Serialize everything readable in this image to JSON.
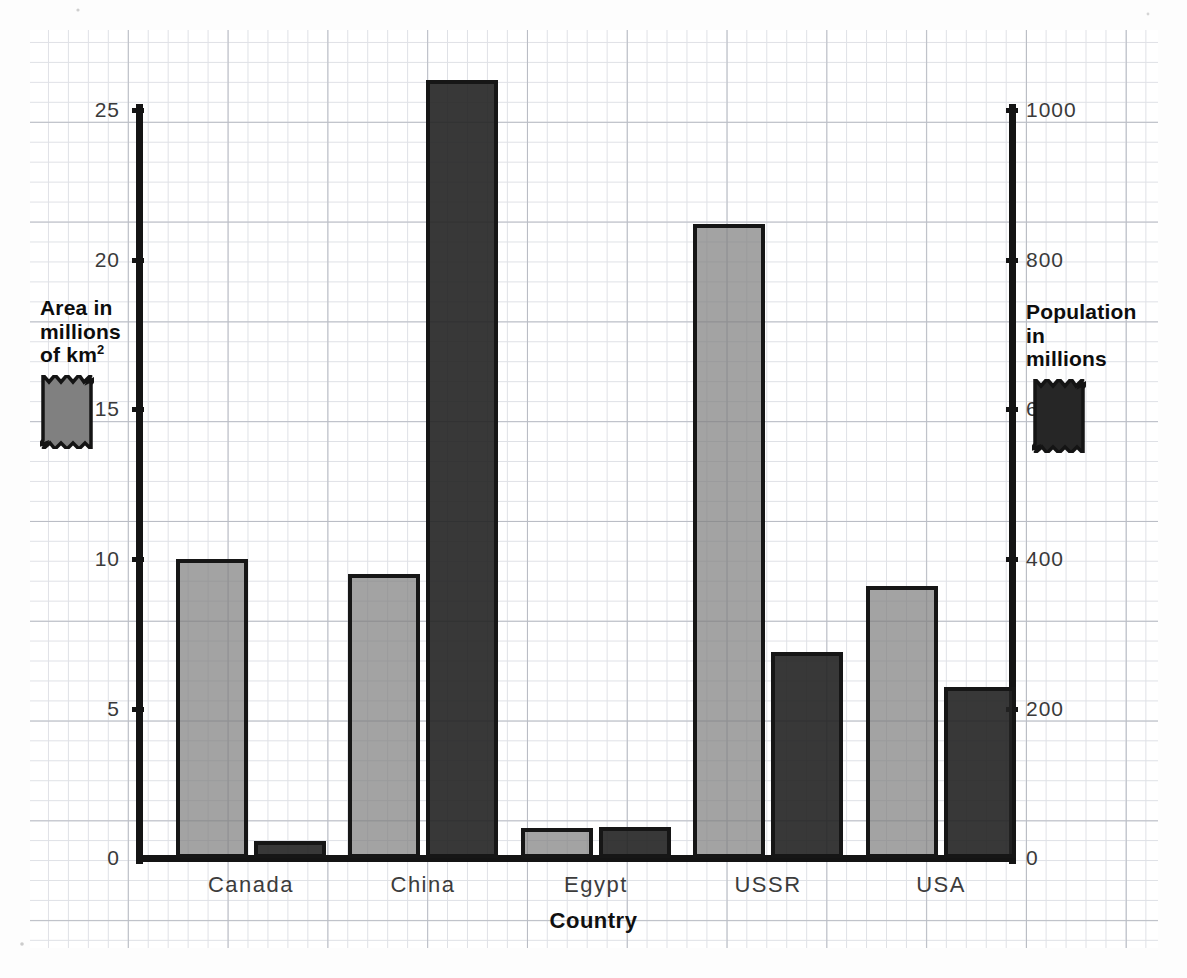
{
  "chart_data": {
    "type": "bar",
    "title": "",
    "subtitle": "",
    "xlabel": "Country",
    "categories": [
      "Canada",
      "China",
      "Egypt",
      "USSR",
      "USA"
    ],
    "grid": true,
    "legend_position": "left and right of plot",
    "series": [
      {
        "name": "Area in millions of km²",
        "short_name": "Area",
        "axis": "left",
        "unit": "millions of km²",
        "color": "#808080",
        "values": [
          10.0,
          9.5,
          1.0,
          21.2,
          9.1
        ]
      },
      {
        "name": "Population in millions",
        "short_name": "Population",
        "axis": "right",
        "unit": "millions",
        "color": "#222222",
        "values": [
          23,
          1040,
          42,
          275,
          228
        ]
      }
    ],
    "left_axis": {
      "label": "Area in millions of km²",
      "ticks": [
        0,
        5,
        10,
        15,
        20,
        25
      ],
      "tick_labels": [
        "0",
        "5",
        "10",
        "15",
        "20",
        "25"
      ],
      "ylim": [
        0,
        25
      ]
    },
    "right_axis": {
      "label": "Population in millions",
      "ticks": [
        0,
        200,
        400,
        600,
        800,
        1000
      ],
      "tick_labels": [
        "0",
        "200",
        "400",
        "600",
        "800",
        "1000"
      ],
      "ylim": [
        0,
        1000
      ]
    }
  },
  "axes": {
    "left_ticks": [
      "25",
      "20",
      "15",
      "10",
      "5",
      "0"
    ],
    "right_ticks": [
      "1000",
      "800",
      "600",
      "400",
      "200",
      "0"
    ]
  },
  "legend_left": {
    "line1": "Area in",
    "line2": "millions",
    "line3_pre": "of km",
    "line3_sup": "2",
    "swatch_color": "#808080"
  },
  "legend_right": {
    "line1": "Population",
    "line2": "in",
    "line3": "millions",
    "swatch_color": "#222222"
  },
  "xaxis": {
    "title": "Country",
    "labels": [
      "Canada",
      "China",
      "Egypt",
      "USSR",
      "USA"
    ]
  }
}
